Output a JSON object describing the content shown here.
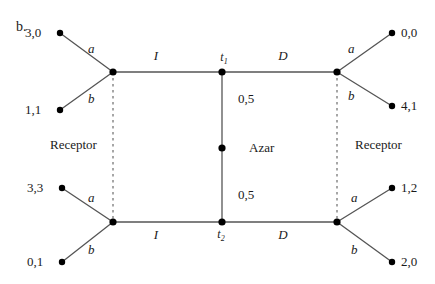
{
  "figure": {
    "panel_tag": "b.",
    "background_color": "#ffffff",
    "line_color": "#555555",
    "node_color": "#000000",
    "dashed_color": "#777777",
    "width": 435,
    "height": 284
  },
  "players": {
    "left_label": "Receptor",
    "center_label": "Azar",
    "right_label": "Receptor"
  },
  "chance": {
    "top_probability": "0,5",
    "bottom_probability": "0,5"
  },
  "decision_nodes": {
    "top_type": "t",
    "top_type_sub": "1",
    "bottom_type": "t",
    "bottom_type_sub": "2"
  },
  "message_edges": {
    "top_left": "I",
    "top_right": "D",
    "bottom_left": "I",
    "bottom_right": "D"
  },
  "action_edges": {
    "top_left_upper": "a",
    "top_left_lower": "b",
    "top_right_upper": "a",
    "top_right_lower": "b",
    "bottom_left_upper": "a",
    "bottom_left_lower": "b",
    "bottom_right_upper": "a",
    "bottom_right_lower": "b"
  },
  "payoffs": {
    "top_left_upper": "3,0",
    "top_left_lower": "1,1",
    "top_right_upper": "0,0",
    "top_right_lower": "4,1",
    "bottom_left_upper": "3,3",
    "bottom_left_lower": "0,1",
    "bottom_right_upper": "1,2",
    "bottom_right_lower": "2,0"
  }
}
